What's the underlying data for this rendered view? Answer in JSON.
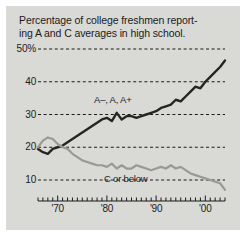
{
  "figure": {
    "title_line1": "Percentage of college freshmen report-",
    "title_line2": "ing A and C averages in high school.",
    "panel_color": "#d9d9d6",
    "page_color": "#ffffff"
  },
  "chart_data": {
    "type": "line",
    "xlabel": "",
    "ylabel": "",
    "xlim": [
      1966,
      2004
    ],
    "ylim": [
      5,
      52
    ],
    "grid": true,
    "grid_style": "dashed-horizontal",
    "legend": "inline-annotations",
    "ytick_labels": [
      "50%",
      "40",
      "30",
      "20",
      "10"
    ],
    "ytick_values": [
      50,
      40,
      30,
      20,
      10
    ],
    "xtick_labels": [
      "'70",
      "'80",
      "'90",
      "'00"
    ],
    "xtick_values": [
      1970,
      1980,
      1990,
      2000
    ],
    "xtick_interval_years": 1,
    "x": [
      1966,
      1967,
      1968,
      1969,
      1970,
      1971,
      1972,
      1973,
      1974,
      1975,
      1976,
      1977,
      1978,
      1979,
      1980,
      1981,
      1982,
      1983,
      1984,
      1985,
      1986,
      1987,
      1988,
      1989,
      1990,
      1991,
      1992,
      1993,
      1994,
      1995,
      1996,
      1997,
      1998,
      1999,
      2000,
      2001,
      2002,
      2003,
      2004
    ],
    "series": [
      {
        "name": "A–, A, A+",
        "color": "#252525",
        "label_text": "A–, A, A+",
        "values": [
          19.5,
          18.5,
          18.0,
          19.5,
          20.0,
          20.5,
          21.5,
          22.5,
          23.5,
          24.5,
          25.5,
          26.5,
          27.5,
          28.5,
          29.0,
          28.0,
          30.5,
          28.5,
          29.5,
          29.5,
          29.0,
          29.5,
          30.0,
          30.5,
          31.0,
          32.0,
          32.5,
          33.0,
          34.5,
          34.0,
          35.5,
          37.0,
          38.5,
          38.0,
          40.0,
          41.5,
          43.0,
          44.5,
          46.5
        ]
      },
      {
        "name": "C or below",
        "color": "#9a9a95",
        "label_text": "C or below",
        "values": [
          20.0,
          22.0,
          23.0,
          22.5,
          21.0,
          20.0,
          19.5,
          18.0,
          17.0,
          16.0,
          15.5,
          15.0,
          14.5,
          14.5,
          14.0,
          15.0,
          13.5,
          14.5,
          13.5,
          13.5,
          14.5,
          14.0,
          13.5,
          13.0,
          13.5,
          14.0,
          13.5,
          14.5,
          13.5,
          14.0,
          13.0,
          12.0,
          11.5,
          11.0,
          10.5,
          10.0,
          9.5,
          9.0,
          7.0
        ]
      }
    ]
  }
}
